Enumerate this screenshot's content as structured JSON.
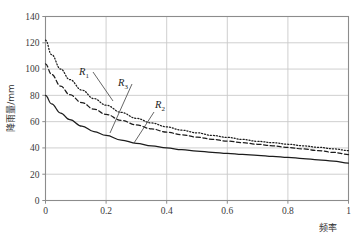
{
  "chart_data": {
    "type": "line",
    "title": "",
    "xlabel": "频率",
    "ylabel": "降雨量/mm",
    "xlim": [
      0,
      1
    ],
    "ylim": [
      0,
      140
    ],
    "grid": true,
    "legend_position": "inline-annotations",
    "x_ticks": [
      "0",
      "0.2",
      "0.4",
      "0.6",
      "0.8",
      "1"
    ],
    "x_tick_values": [
      0,
      0.2,
      0.4,
      0.6,
      0.8,
      1
    ],
    "y_ticks": [
      "0",
      "20",
      "40",
      "60",
      "80",
      "100",
      "120",
      "140"
    ],
    "y_tick_values": [
      0,
      20,
      40,
      60,
      80,
      100,
      120,
      140
    ],
    "x": [
      0,
      0.02,
      0.05,
      0.08,
      0.12,
      0.16,
      0.2,
      0.25,
      0.3,
      0.35,
      0.4,
      0.45,
      0.5,
      0.55,
      0.6,
      0.65,
      0.7,
      0.75,
      0.8,
      0.85,
      0.9,
      0.95,
      1
    ],
    "series": [
      {
        "name": "R1",
        "label": "R",
        "subscript": "1",
        "style": "dotted",
        "color": "#1c1c1c",
        "values": [
          122,
          111,
          100,
          92,
          84,
          77.5,
          72.5,
          67,
          62.5,
          59,
          56,
          53.5,
          51.5,
          49.5,
          48,
          46.5,
          45,
          44,
          42.8,
          41.6,
          40.5,
          39.3,
          38
        ]
      },
      {
        "name": "R3",
        "label": "R",
        "subscript": "3",
        "style": "dashed",
        "color": "#1c1c1c",
        "values": [
          104,
          96,
          87,
          80.5,
          74.5,
          69.5,
          65.5,
          61,
          57.5,
          54.5,
          52,
          50,
          48.2,
          46.6,
          45.2,
          44,
          42.8,
          41.6,
          40.4,
          39.2,
          38,
          36.6,
          35
        ]
      },
      {
        "name": "R2",
        "label": "R",
        "subscript": "2",
        "style": "solid",
        "color": "#1c1c1c",
        "values": [
          80,
          73.5,
          66.5,
          61.5,
          56.5,
          52.5,
          49.5,
          46,
          43.5,
          41.5,
          40,
          38.7,
          37.6,
          36.7,
          35.9,
          35.1,
          34.4,
          33.6,
          32.8,
          31.9,
          31,
          29.9,
          28.5
        ]
      }
    ],
    "annotations": [
      {
        "name": "R1",
        "label": "R",
        "subscript": "1",
        "label_x": 79,
        "label_y": 75,
        "leader_x1": 93,
        "leader_y1": 72,
        "leader_x2": 113,
        "leader_y2": 101
      },
      {
        "name": "R3",
        "label": "R",
        "subscript": "3",
        "label_x": 118,
        "label_y": 86,
        "leader_x1": 132,
        "leader_y1": 84,
        "leader_x2": 110,
        "leader_y2": 133
      },
      {
        "name": "R2",
        "label": "R",
        "subscript": "2",
        "label_x": 155,
        "label_y": 108,
        "leader_x1": 154,
        "leader_y1": 112,
        "leader_x2": 134,
        "leader_y2": 143
      }
    ]
  },
  "style": {
    "frame_color": "#8c8c8c",
    "grid_color": "#c9c9c9",
    "background": "#ffffff",
    "tick_text_color": "#3a3a3a"
  }
}
